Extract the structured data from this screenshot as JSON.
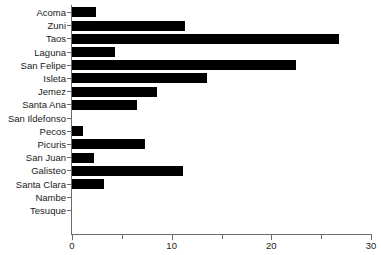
{
  "chart_data": {
    "type": "bar",
    "orientation": "horizontal",
    "title": "",
    "xlabel": "",
    "ylabel": "",
    "xlim": [
      0,
      30
    ],
    "ylim": null,
    "grid": false,
    "legend": null,
    "bar_color": "#000000",
    "axis_color": "#6b6b6b",
    "xticks": [
      0,
      5,
      10,
      15,
      20,
      25,
      30
    ],
    "xtick_labels": [
      "0",
      "",
      "10",
      "",
      "20",
      "",
      "30"
    ],
    "categories": [
      "Acoma",
      "Zuni",
      "Taos",
      "Laguna",
      "San Felipe",
      "Isleta",
      "Jemez",
      "Santa Ana",
      "San Ildefonso",
      "Pecos",
      "Picuris",
      "San Juan",
      "Galisteo",
      "Santa Clara",
      "Nambe",
      "Tesuque"
    ],
    "values": [
      2.4,
      11.3,
      26.8,
      4.3,
      22.5,
      13.5,
      8.5,
      6.5,
      0,
      1.1,
      7.3,
      2.2,
      11.1,
      3.2,
      0,
      0
    ]
  }
}
